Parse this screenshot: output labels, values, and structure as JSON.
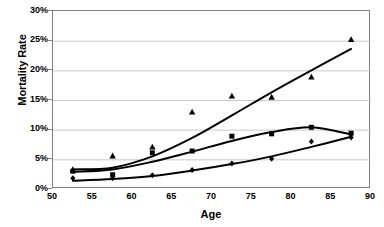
{
  "chart_data": {
    "type": "scatter",
    "title": "",
    "xlabel": "Age",
    "ylabel": "Mortality Rate",
    "xlim": [
      50,
      90
    ],
    "ylim": [
      0,
      30
    ],
    "xticks": [
      50,
      55,
      60,
      65,
      70,
      75,
      80,
      85,
      90
    ],
    "yticks": [
      0,
      5,
      10,
      15,
      20,
      25,
      30
    ],
    "xtick_labels": [
      "50",
      "55",
      "60",
      "65",
      "70",
      "75",
      "80",
      "85",
      "90"
    ],
    "ytick_labels": [
      "0%",
      "5%",
      "10%",
      "15%",
      "20%",
      "25%",
      "30%"
    ],
    "grid": "horizontal",
    "legend": "none",
    "x": [
      52.5,
      57.5,
      62.5,
      67.5,
      72.5,
      77.5,
      82.5,
      87.5
    ],
    "series": [
      {
        "name": "upper-series",
        "marker": "triangle",
        "color": "#000000",
        "values": [
          3.3,
          5.6,
          7.1,
          13.0,
          15.7,
          15.5,
          18.9,
          25.2
        ],
        "fit_values": [
          3.3,
          3.6,
          5.5,
          8.6,
          12.4,
          16.3,
          20.0,
          23.6
        ]
      },
      {
        "name": "middle-series",
        "marker": "square",
        "color": "#000000",
        "values": [
          3.0,
          2.4,
          6.1,
          6.4,
          8.9,
          9.3,
          10.4,
          9.4
        ],
        "fit_values": [
          2.9,
          3.3,
          4.6,
          6.3,
          8.1,
          9.6,
          10.4,
          9.2
        ]
      },
      {
        "name": "lower-series",
        "marker": "diamond",
        "color": "#000000",
        "values": [
          1.8,
          1.8,
          2.3,
          3.2,
          4.3,
          5.1,
          8.0,
          8.7
        ],
        "fit_values": [
          1.4,
          1.7,
          2.2,
          3.1,
          4.2,
          5.5,
          7.1,
          8.8
        ]
      }
    ]
  },
  "axes": {
    "x_title": "Age",
    "y_title": "Mortality Rate"
  }
}
